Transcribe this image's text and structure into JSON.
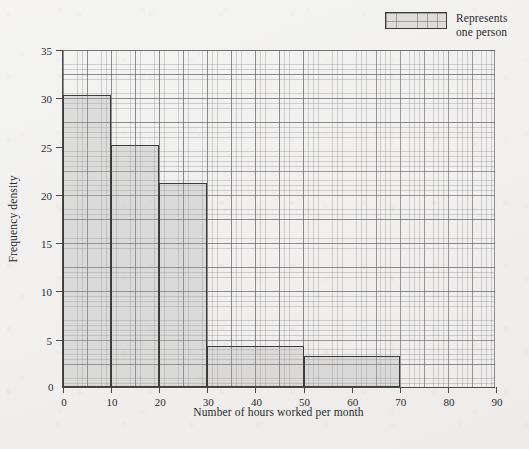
{
  "legend": {
    "label": "Represents\none person",
    "swatch_name": "grid-square-swatch"
  },
  "axes": {
    "x_title": "Number of hours worked per month",
    "y_title": "Frequency density",
    "y_zero": "0"
  },
  "chart_data": {
    "type": "bar",
    "title": "",
    "subtitle": "",
    "xlabel": "Number of hours worked per month",
    "ylabel": "Frequency density",
    "xlim": [
      0,
      90
    ],
    "ylim": [
      0,
      35
    ],
    "grid": true,
    "legend_position": "top-right",
    "legend_entries": [
      "Represents one person"
    ],
    "xticks": [
      0,
      10,
      20,
      30,
      40,
      50,
      60,
      70,
      80,
      90
    ],
    "xtick_labels": [
      "0",
      "10",
      "20",
      "30",
      "40",
      "50",
      "60",
      "70",
      "80",
      "90"
    ],
    "yticks": [
      0,
      5,
      10,
      15,
      20,
      25,
      30,
      35
    ],
    "ytick_labels": [
      "0",
      "5",
      "10",
      "15",
      "20",
      "25",
      "30",
      "35"
    ],
    "bins": [
      {
        "label": "0-10",
        "x0": 0,
        "x1": 10,
        "value": 30.2,
        "frequency": 302
      },
      {
        "label": "10-20",
        "x0": 10,
        "x1": 20,
        "value": 25.1,
        "frequency": 251
      },
      {
        "label": "20-30",
        "x0": 20,
        "x1": 30,
        "value": 21.1,
        "frequency": 211
      },
      {
        "label": "30-50",
        "x0": 30,
        "x1": 50,
        "value": 4.2,
        "frequency": 84
      },
      {
        "label": "50-70",
        "x0": 50,
        "x1": 70,
        "value": 3.2,
        "frequency": 64
      }
    ],
    "categories": [
      "0-10",
      "10-20",
      "20-30",
      "30-50",
      "50-70"
    ],
    "values": [
      30.2,
      25.1,
      21.1,
      4.2,
      3.2
    ],
    "colors": {
      "bar_fill": "#d8d7d6",
      "bar_stroke": "#3c3c3c",
      "grid_minor": "#9a9ca2",
      "grid_major": "#5c5e66",
      "axis": "#4a4a4a",
      "background": "#f1f0ef",
      "text": "#2b2b2b"
    }
  }
}
